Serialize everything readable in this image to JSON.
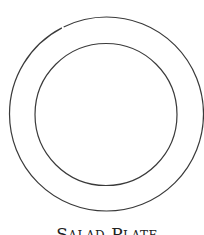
{
  "diagram": {
    "title": "Salad Plate",
    "colors": {
      "stroke": "#3a3a3a",
      "background": "#ffffff",
      "text": "#222222"
    },
    "shapes": [
      {
        "name": "outer-rim",
        "type": "circle",
        "cx": 106.5,
        "cy": 114,
        "r": 97
      },
      {
        "name": "inner-well",
        "type": "circle",
        "cx": 106,
        "cy": 114.5,
        "r": 71
      }
    ]
  }
}
